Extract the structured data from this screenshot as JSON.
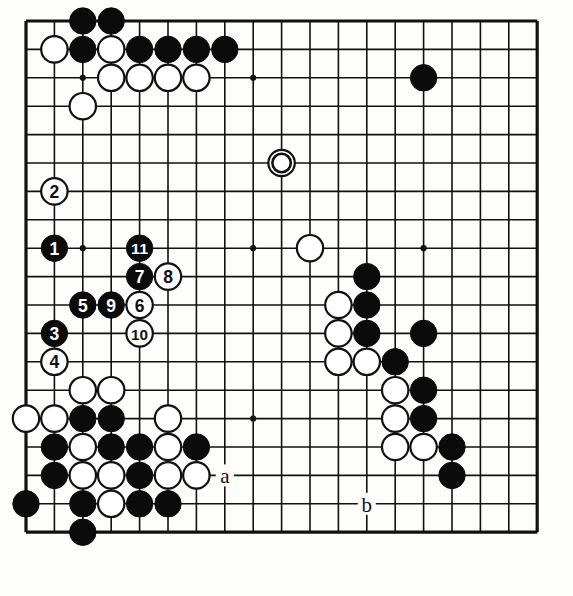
{
  "diagram": {
    "type": "go-board-problem-diagram",
    "board_size": 19,
    "visible_region": {
      "cols": 19,
      "rows": 19,
      "note": "cropped board showing left, top, right and bottom edges"
    },
    "geometry": {
      "origin_x": 26,
      "origin_y": 21,
      "cell": 28.4,
      "cols": 19,
      "rows": 19,
      "stone_radius": 13.2
    },
    "colors": {
      "black": "#0b0b0b",
      "white": "#ffffff",
      "line": "#111111",
      "paper": "#fdfdfc"
    },
    "star_points": [
      {
        "c": 3,
        "r": 3
      },
      {
        "c": 9,
        "r": 3
      },
      {
        "c": 15,
        "r": 3
      },
      {
        "c": 3,
        "r": 9
      },
      {
        "c": 9,
        "r": 9
      },
      {
        "c": 15,
        "r": 9
      },
      {
        "c": 3,
        "r": 15
      },
      {
        "c": 9,
        "r": 15
      },
      {
        "c": 15,
        "r": 15
      }
    ],
    "plain_stones": [
      {
        "c": 3,
        "r": 1,
        "color": "black"
      },
      {
        "c": 4,
        "r": 1,
        "color": "black"
      },
      {
        "c": 2,
        "r": 2,
        "color": "white"
      },
      {
        "c": 3,
        "r": 2,
        "color": "black"
      },
      {
        "c": 4,
        "r": 2,
        "color": "white"
      },
      {
        "c": 5,
        "r": 2,
        "color": "black"
      },
      {
        "c": 6,
        "r": 2,
        "color": "black"
      },
      {
        "c": 7,
        "r": 2,
        "color": "black"
      },
      {
        "c": 8,
        "r": 2,
        "color": "black"
      },
      {
        "c": 4,
        "r": 3,
        "color": "white"
      },
      {
        "c": 5,
        "r": 3,
        "color": "white"
      },
      {
        "c": 6,
        "r": 3,
        "color": "white"
      },
      {
        "c": 7,
        "r": 3,
        "color": "white"
      },
      {
        "c": 3,
        "r": 4,
        "color": "white"
      },
      {
        "c": 15,
        "r": 3,
        "color": "black"
      },
      {
        "c": 11,
        "r": 9,
        "color": "white"
      },
      {
        "c": 13,
        "r": 10,
        "color": "black"
      },
      {
        "c": 12,
        "r": 11,
        "color": "white"
      },
      {
        "c": 13,
        "r": 11,
        "color": "black"
      },
      {
        "c": 12,
        "r": 12,
        "color": "white"
      },
      {
        "c": 13,
        "r": 12,
        "color": "black"
      },
      {
        "c": 15,
        "r": 12,
        "color": "black"
      },
      {
        "c": 12,
        "r": 13,
        "color": "white"
      },
      {
        "c": 13,
        "r": 13,
        "color": "white"
      },
      {
        "c": 14,
        "r": 13,
        "color": "black"
      },
      {
        "c": 14,
        "r": 14,
        "color": "white"
      },
      {
        "c": 15,
        "r": 14,
        "color": "black"
      },
      {
        "c": 14,
        "r": 15,
        "color": "white"
      },
      {
        "c": 15,
        "r": 15,
        "color": "black"
      },
      {
        "c": 14,
        "r": 16,
        "color": "white"
      },
      {
        "c": 15,
        "r": 16,
        "color": "white"
      },
      {
        "c": 16,
        "r": 16,
        "color": "black"
      },
      {
        "c": 16,
        "r": 17,
        "color": "black"
      },
      {
        "c": 3,
        "r": 14,
        "color": "white"
      },
      {
        "c": 4,
        "r": 14,
        "color": "white"
      },
      {
        "c": 1,
        "r": 15,
        "color": "white"
      },
      {
        "c": 2,
        "r": 15,
        "color": "white"
      },
      {
        "c": 3,
        "r": 15,
        "color": "black"
      },
      {
        "c": 4,
        "r": 15,
        "color": "black"
      },
      {
        "c": 6,
        "r": 15,
        "color": "white"
      },
      {
        "c": 2,
        "r": 16,
        "color": "black"
      },
      {
        "c": 3,
        "r": 16,
        "color": "white"
      },
      {
        "c": 4,
        "r": 16,
        "color": "black"
      },
      {
        "c": 5,
        "r": 16,
        "color": "black"
      },
      {
        "c": 6,
        "r": 16,
        "color": "white"
      },
      {
        "c": 7,
        "r": 16,
        "color": "black"
      },
      {
        "c": 2,
        "r": 17,
        "color": "black"
      },
      {
        "c": 3,
        "r": 17,
        "color": "white"
      },
      {
        "c": 4,
        "r": 17,
        "color": "white"
      },
      {
        "c": 5,
        "r": 17,
        "color": "black"
      },
      {
        "c": 6,
        "r": 17,
        "color": "white"
      },
      {
        "c": 7,
        "r": 17,
        "color": "white"
      },
      {
        "c": 1,
        "r": 18,
        "color": "black"
      },
      {
        "c": 3,
        "r": 18,
        "color": "black"
      },
      {
        "c": 4,
        "r": 18,
        "color": "white"
      },
      {
        "c": 5,
        "r": 18,
        "color": "black"
      },
      {
        "c": 6,
        "r": 18,
        "color": "black"
      },
      {
        "c": 3,
        "r": 19,
        "color": "black"
      }
    ],
    "marked_stones": [
      {
        "c": 10,
        "r": 6,
        "color": "white",
        "mark": "circle"
      }
    ],
    "numbered_stones": [
      {
        "n": 1,
        "c": 2,
        "r": 9,
        "color": "black"
      },
      {
        "n": 2,
        "c": 2,
        "r": 7,
        "color": "white"
      },
      {
        "n": 3,
        "c": 2,
        "r": 12,
        "color": "black"
      },
      {
        "n": 4,
        "c": 2,
        "r": 13,
        "color": "white"
      },
      {
        "n": 5,
        "c": 3,
        "r": 11,
        "color": "black"
      },
      {
        "n": 6,
        "c": 5,
        "r": 11,
        "color": "white"
      },
      {
        "n": 7,
        "c": 5,
        "r": 10,
        "color": "black"
      },
      {
        "n": 8,
        "c": 6,
        "r": 10,
        "color": "white"
      },
      {
        "n": 9,
        "c": 4,
        "r": 11,
        "color": "black"
      },
      {
        "n": 10,
        "c": 5,
        "r": 12,
        "color": "white"
      },
      {
        "n": 11,
        "c": 5,
        "r": 9,
        "color": "black"
      }
    ],
    "point_labels": [
      {
        "text": "a",
        "c": 8,
        "r": 17
      },
      {
        "text": "b",
        "c": 13,
        "r": 18
      }
    ]
  }
}
